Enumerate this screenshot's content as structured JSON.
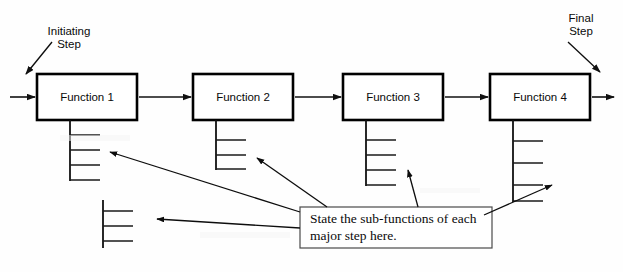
{
  "diagram": {
    "background_color": "#fefefe",
    "line_color": "#000000",
    "boxes": [
      {
        "id": "function-1",
        "label": "Function 1",
        "x": 37,
        "y": 74,
        "w": 100,
        "h": 46,
        "sub_branches": 4
      },
      {
        "id": "function-2",
        "label": "Function 2",
        "x": 193,
        "y": 74,
        "w": 100,
        "h": 46,
        "sub_branches": 3
      },
      {
        "id": "function-3",
        "label": "Function 3",
        "x": 343,
        "y": 74,
        "w": 100,
        "h": 46,
        "sub_branches": 4
      },
      {
        "id": "function-4",
        "label": "Function 4",
        "x": 490,
        "y": 74,
        "w": 100,
        "h": 46,
        "sub_branches": 4
      }
    ],
    "extra_comb": {
      "id": "sub-function-comb-extra",
      "x": 103,
      "y": 200,
      "branches": 3
    },
    "labels": {
      "initiating_step_line1": "Initiating",
      "initiating_step_line2": "Step",
      "final_step_line1": "Final",
      "final_step_line2": "Step"
    },
    "callout": {
      "line1": "State the sub-functions of each",
      "line2": "major step here.",
      "x": 300,
      "y": 207,
      "w": 192,
      "h": 41
    }
  }
}
